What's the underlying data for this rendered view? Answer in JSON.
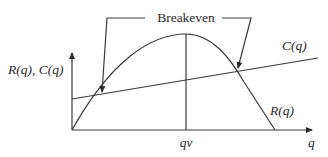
{
  "diagram": {
    "title_annotation": "Breakeven",
    "y_axis_label": "R(q), C(q)",
    "x_axis_label": "q",
    "peak_tick_label": "qv",
    "curves": {
      "revenue_label": "R(q)",
      "cost_label": "C(q)"
    },
    "colors": {
      "line": "#3a3a3a",
      "text": "#2a2a2a",
      "background": "#ffffff"
    }
  }
}
